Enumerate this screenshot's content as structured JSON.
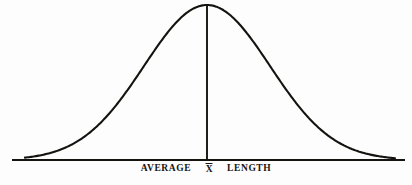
{
  "figure": {
    "kind": "normal-distribution-bell-curve",
    "background_color": "#fdfdfd",
    "ink_color": "#15130f"
  },
  "caption": {
    "left_label": "AVERAGE",
    "center_symbol": "X",
    "center_symbol_name": "x-bar",
    "right_label": "LENGTH"
  },
  "chart_data": {
    "type": "line",
    "title": "",
    "subtitle": "",
    "xlabel": "AVERAGE X̄ LENGTH",
    "ylabel": "",
    "grid": false,
    "legend": null,
    "axis": {
      "baseline_y_px": 160,
      "baseline_x_start_px": 12,
      "baseline_x_end_px": 405,
      "show_y_axis": false,
      "show_x_axis": true
    },
    "distribution": {
      "name": "normal",
      "mean_x_px": 207,
      "sigma_px": 63,
      "peak_y_px": 5,
      "amplitude_px": 155,
      "left_tail_x_px": 25,
      "right_tail_x_px": 395
    },
    "center_line": {
      "x_px": 207,
      "y_top_px": 5,
      "y_bottom_px": 160
    },
    "annotations": [
      {
        "text": "AVERAGE",
        "x_px": 172,
        "y_px": 172
      },
      {
        "text": "X̄",
        "x_px": 207,
        "y_px": 172
      },
      {
        "text": "LENGTH",
        "x_px": 244,
        "y_px": 172
      }
    ],
    "x": [
      25,
      40,
      55,
      70,
      85,
      100,
      115,
      130,
      145,
      160,
      175,
      190,
      207,
      224,
      239,
      254,
      269,
      284,
      299,
      314,
      329,
      344,
      359,
      374,
      395
    ],
    "values": [
      1,
      2,
      5,
      10,
      18,
      31,
      49,
      71,
      96,
      120,
      140,
      152,
      155,
      152,
      141,
      123,
      99,
      74,
      52,
      33,
      19,
      10,
      5,
      2,
      1
    ]
  }
}
